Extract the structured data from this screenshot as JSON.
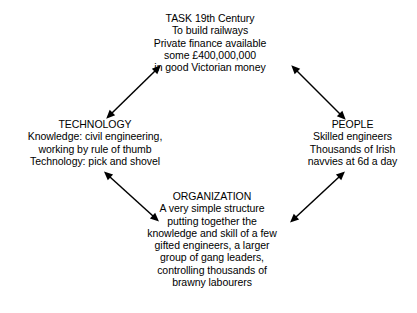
{
  "diagram": {
    "type": "cycle-diagram",
    "title": "TASK 19th Century",
    "node_count": 4,
    "arrow_count": 4,
    "line_color": "#000000",
    "text_color": "#000000",
    "background_color": "#ffffff"
  },
  "nodes": {
    "task": {
      "heading": "TASK 19th Century",
      "lines": [
        "To build railways",
        "Private finance available",
        "some £400,000,000",
        "in good Victorian money"
      ]
    },
    "technology": {
      "heading": "TECHNOLOGY",
      "lines": [
        "Knowledge: civil engineering,",
        "working by rule of thumb",
        "Technology: pick and shovel"
      ]
    },
    "people": {
      "heading": "PEOPLE",
      "lines": [
        "Skilled engineers",
        "Thousands of Irish",
        "navvies at 6d a day"
      ]
    },
    "organization": {
      "heading": "ORGANIZATION",
      "lines": [
        "A very simple structure",
        "putting together the",
        "knowledge and skill of a few",
        "gifted engineers, a larger",
        "group of gang leaders,",
        "controlling thousands of",
        "brawny labourers"
      ]
    }
  },
  "connectors": [
    {
      "id": "task-technology",
      "from": "task",
      "to": "technology",
      "style": "double-headed",
      "x1": 155,
      "y1": 71,
      "x2": 112,
      "y2": 113
    },
    {
      "id": "task-people",
      "from": "task",
      "to": "people",
      "style": "double-headed",
      "x1": 297,
      "y1": 71,
      "x2": 340,
      "y2": 114
    },
    {
      "id": "technology-organization",
      "from": "technology",
      "to": "organization",
      "style": "double-headed",
      "x1": 110,
      "y1": 177,
      "x2": 153,
      "y2": 216
    },
    {
      "id": "people-organization",
      "from": "people",
      "to": "organization",
      "style": "double-headed",
      "x1": 339,
      "y1": 177,
      "x2": 296,
      "y2": 217
    }
  ]
}
